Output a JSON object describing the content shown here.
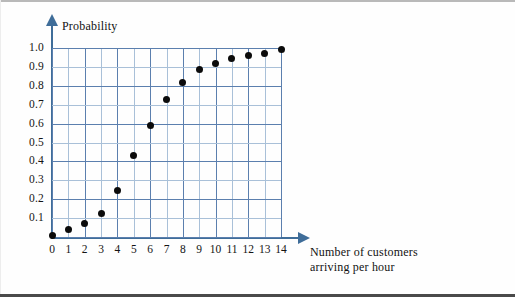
{
  "chart_data": {
    "type": "scatter",
    "title": "",
    "xlabel": "Number of customers arriving per hour",
    "ylabel": "Probability",
    "x": [
      0,
      1,
      2,
      3,
      4,
      5,
      6,
      7,
      8,
      9,
      10,
      11,
      12,
      13,
      14
    ],
    "values": [
      0.01,
      0.04,
      0.07,
      0.125,
      0.245,
      0.43,
      0.59,
      0.725,
      0.82,
      0.885,
      0.92,
      0.945,
      0.96,
      0.97,
      0.99
    ],
    "xlim": [
      0,
      14
    ],
    "ylim": [
      0,
      1.0
    ],
    "xticks": [
      "0",
      "1",
      "2",
      "3",
      "4",
      "5",
      "6",
      "7",
      "8",
      "9",
      "10",
      "11",
      "12",
      "13",
      "14"
    ],
    "yticks": [
      "0.1",
      "0.2",
      "0.3",
      "0.4",
      "0.5",
      "0.6",
      "0.7",
      "0.8",
      "0.9",
      "1.0"
    ],
    "ytick_values": [
      0.1,
      0.2,
      0.3,
      0.4,
      0.5,
      0.6,
      0.7,
      0.8,
      0.9,
      1.0
    ],
    "grid": true,
    "legend": null,
    "marker": "filled-circle",
    "marker_color": "#0b0b0b",
    "grid_color": "#5b7fae",
    "grid_color_minor": "#a9c0d8",
    "axis_color": "#3f6d99",
    "annotations": []
  },
  "axes": {
    "y_title": "Probability",
    "x_title_line1": "Number of customers",
    "x_title_line2": "arriving per hour"
  }
}
